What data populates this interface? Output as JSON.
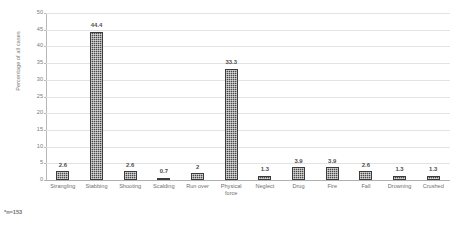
{
  "chart_data": {
    "type": "bar",
    "title": "",
    "subtitle": "",
    "xlabel": "",
    "ylabel": "Percentage of all cases",
    "ylim": [
      0,
      50
    ],
    "ytick_step": 5,
    "yticks": [
      "0",
      "5",
      "10",
      "15",
      "20",
      "25",
      "30",
      "35",
      "40",
      "45",
      "50"
    ],
    "grid": true,
    "legend": false,
    "categories": [
      "Strangling",
      "Stabbing",
      "Shooting",
      "Scalding",
      "Run over",
      "Physical\nforce",
      "Neglect",
      "Drug",
      "Fire",
      "Fall",
      "Drowning",
      "Crushed"
    ],
    "values": [
      2.6,
      44.4,
      2.6,
      0.7,
      2,
      33.3,
      1.3,
      3.9,
      3.9,
      2.6,
      1.3,
      1.3
    ],
    "value_labels": [
      "2.6",
      "44.4",
      "2.6",
      "0.7",
      "2",
      "33.3",
      "1.3",
      "3.9",
      "3.9",
      "2.6",
      "1.3",
      "1.3"
    ],
    "annotations": [
      "*n=153"
    ],
    "colors": {
      "bar_fill": "#4a4a4a",
      "bar_edge": "#3b3b3b",
      "gridline": "#e3e3e3",
      "axis_line": "#b8b8b8",
      "baseline": "#b0b0b0",
      "text": "#6f6f6f",
      "background": "#ffffff"
    }
  },
  "footnote": {
    "text": "*n=153"
  }
}
